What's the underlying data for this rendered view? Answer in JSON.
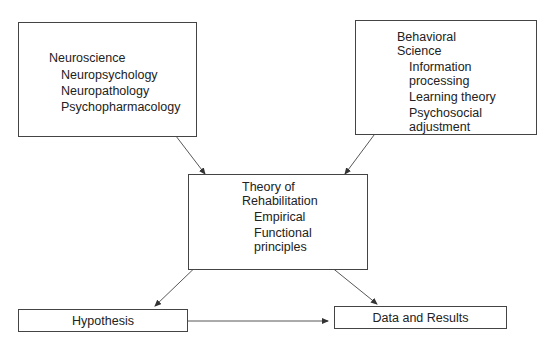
{
  "nodes": {
    "neuroscience": {
      "title": "Neuroscience",
      "items": [
        "Neuropsychology",
        "Neuropathology",
        "Psychopharmacology"
      ]
    },
    "behavioral": {
      "title_lines": [
        "Behavioral",
        "Science"
      ],
      "item_lines": [
        "Information",
        "processing",
        "Learning theory",
        "Psychosocial",
        "adjustment"
      ]
    },
    "theory": {
      "title_lines": [
        "Theory of",
        "Rehabilitation"
      ],
      "item_lines": [
        "Empirical",
        "Functional",
        "principles"
      ]
    },
    "hypothesis": {
      "label": "Hypothesis"
    },
    "data_results": {
      "label": "Data and Results"
    }
  },
  "edges": [
    {
      "from": "neuroscience",
      "to": "theory",
      "type": "bidirectional"
    },
    {
      "from": "behavioral",
      "to": "theory",
      "type": "bidirectional"
    },
    {
      "from": "theory",
      "to": "hypothesis",
      "type": "bidirectional"
    },
    {
      "from": "theory",
      "to": "data_results",
      "type": "bidirectional"
    },
    {
      "from": "hypothesis",
      "to": "data_results",
      "type": "directed"
    }
  ]
}
